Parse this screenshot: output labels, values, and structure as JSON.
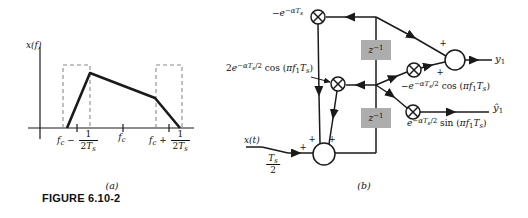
{
  "figure": {
    "caption_a": "(a)",
    "caption_b": "(b)",
    "title": "FIGURE 6.10-2"
  },
  "colors": {
    "line": "#1a1a1a",
    "delay_fill": "#adadad",
    "dash_gray": "#8a8a8a",
    "background": "#ffffff"
  },
  "panel_a": {
    "type": "spectrum-sketch",
    "axis_label": [
      {
        "t": "x(f)",
        "s": "i"
      }
    ],
    "curve_points_px": "67,128 90,73 155,98 180,128",
    "tick_left": {
      "pre": [
        {
          "t": "f",
          "s": "i"
        },
        {
          "t": "c",
          "s": "sub"
        },
        {
          "t": " − ",
          "s": "n"
        }
      ],
      "num": [
        {
          "t": "1",
          "s": "n"
        }
      ],
      "den": [
        {
          "t": "2",
          "s": "n"
        },
        {
          "t": "T",
          "s": "i"
        },
        {
          "t": "s",
          "s": "sub"
        }
      ]
    },
    "tick_center": [
      {
        "t": "f",
        "s": "i"
      },
      {
        "t": "c",
        "s": "sub"
      }
    ],
    "tick_right": {
      "pre": [
        {
          "t": "f",
          "s": "i"
        },
        {
          "t": "c",
          "s": "sub"
        },
        {
          "t": " + ",
          "s": "n"
        }
      ],
      "num": [
        {
          "t": "1",
          "s": "n"
        }
      ],
      "den": [
        {
          "t": "2",
          "s": "n"
        },
        {
          "t": "T",
          "s": "i"
        },
        {
          "t": "s",
          "s": "sub"
        }
      ]
    }
  },
  "panel_b": {
    "type": "block-diagram",
    "plus": "+",
    "delay_label": [
      {
        "t": "z",
        "s": "i"
      },
      {
        "t": "−1",
        "s": "supn"
      }
    ],
    "coeff_top": [
      {
        "t": "−",
        "s": "n"
      },
      {
        "t": "e",
        "s": "i"
      },
      {
        "t": "−αT",
        "s": "sup"
      },
      {
        "t": "s",
        "s": "ss"
      }
    ],
    "coeff_mid": [
      {
        "t": "2",
        "s": "n"
      },
      {
        "t": "e",
        "s": "i"
      },
      {
        "t": "−αT",
        "s": "sup"
      },
      {
        "t": "s",
        "s": "ss"
      },
      {
        "t": "/2",
        "s": "supn"
      },
      {
        "t": " cos (",
        "s": "n"
      },
      {
        "t": "πf",
        "s": "i"
      },
      {
        "t": "1",
        "s": "subn"
      },
      {
        "t": "T",
        "s": "i"
      },
      {
        "t": "s",
        "s": "sub"
      },
      {
        "t": ")",
        "s": "n"
      }
    ],
    "coeff_cos": [
      {
        "t": "−",
        "s": "n"
      },
      {
        "t": "e",
        "s": "i"
      },
      {
        "t": "−αT",
        "s": "sup"
      },
      {
        "t": "s",
        "s": "ss"
      },
      {
        "t": "/2",
        "s": "supn"
      },
      {
        "t": " cos (",
        "s": "n"
      },
      {
        "t": "πf",
        "s": "i"
      },
      {
        "t": "1",
        "s": "subn"
      },
      {
        "t": "T",
        "s": "i"
      },
      {
        "t": "s",
        "s": "sub"
      },
      {
        "t": ")",
        "s": "n"
      }
    ],
    "coeff_sin": [
      {
        "t": "e",
        "s": "i"
      },
      {
        "t": "−αT",
        "s": "sup"
      },
      {
        "t": "s",
        "s": "ss"
      },
      {
        "t": "/2",
        "s": "supn"
      },
      {
        "t": " sin (",
        "s": "n"
      },
      {
        "t": "πf",
        "s": "i"
      },
      {
        "t": "1",
        "s": "subn"
      },
      {
        "t": "T",
        "s": "i"
      },
      {
        "t": "s",
        "s": "sub"
      },
      {
        "t": ")",
        "s": "n"
      }
    ],
    "input_label": [
      {
        "t": "x(t)",
        "s": "i"
      }
    ],
    "sample_rate": {
      "num": [
        {
          "t": "T",
          "s": "i"
        },
        {
          "t": "s",
          "s": "sub"
        }
      ],
      "den": [
        {
          "t": "2",
          "s": "n"
        }
      ]
    },
    "output_y1": [
      {
        "t": "y",
        "s": "i"
      },
      {
        "t": "1",
        "s": "subn"
      }
    ],
    "output_y1hat": [
      {
        "t": "ŷ",
        "s": "i"
      },
      {
        "t": "1",
        "s": "subn"
      }
    ]
  }
}
